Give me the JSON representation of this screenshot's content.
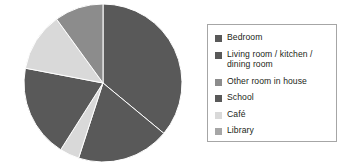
{
  "chart_data": {
    "type": "pie",
    "title": "",
    "legend_position": "right",
    "categories": [
      "Bedroom",
      "Living room / kitchen / dining room",
      "Other room in house",
      "School",
      "Café",
      "Library"
    ],
    "values": [
      36,
      19,
      10,
      19,
      4,
      12
    ],
    "units": "percent",
    "colors": [
      "#595959",
      "#595959",
      "#8c8c8c",
      "#595959",
      "#d9d9d9",
      "#a6a6a6"
    ],
    "slice_order_clockwise_from_12": [
      {
        "label": "Bedroom",
        "value": 36,
        "color": "#595959"
      },
      {
        "label": "Living room / kitchen / dining room",
        "value": 19,
        "color": "#595959"
      },
      {
        "label": "Café",
        "value": 4,
        "color": "#d9d9d9"
      },
      {
        "label": "School",
        "value": 19,
        "color": "#595959"
      },
      {
        "label": "Library",
        "value": 12,
        "color": "#d9d9d9"
      },
      {
        "label": "Other room in house",
        "value": 10,
        "color": "#8c8c8c"
      }
    ],
    "xlabel": "",
    "ylabel": "",
    "grid": false
  },
  "legend": {
    "items": [
      {
        "label": "Bedroom",
        "color": "#595959"
      },
      {
        "label": "Living room / kitchen /\ndining room",
        "color": "#595959"
      },
      {
        "label": "Other room in house",
        "color": "#8c8c8c"
      },
      {
        "label": "School",
        "color": "#595959"
      },
      {
        "label": "Café",
        "color": "#d9d9d9"
      },
      {
        "label": "Library",
        "color": "#a6a6a6"
      }
    ],
    "border_color": "#a6a6a6"
  },
  "pie": {
    "center_x": 103,
    "center_y": 83,
    "radius": 79,
    "separator_color": "#ffffff"
  }
}
